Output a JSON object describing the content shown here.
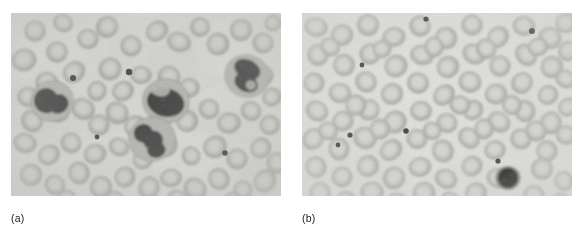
{
  "figure": {
    "kind": "photomicrograph-pair",
    "modality": "light microscopy, stained peripheral blood smear",
    "rendering": "grayscale",
    "panel_count": 2
  },
  "panels": [
    {
      "id": "a",
      "caption": "(a)",
      "label_letter": "a",
      "description": "Peripheral blood smear showing several large dark-stained leukocytes with lobed nuclei among loosely scattered erythrocytes",
      "frame": {
        "x": 11,
        "y": 13,
        "width": 270,
        "height": 183
      },
      "background_color": "#d9d9d6",
      "vignette_color": "#c6c6c2",
      "cell_counts": {
        "erythrocytes": 64,
        "leukocytes": 4,
        "platelets": 4
      },
      "erythrocyte_fill": "#c2c2bd",
      "erythrocyte_rim": "#a8a8a3",
      "erythrocyte_center": "#d2d2ce",
      "leukocyte_cytoplasm": "#b9b9b4",
      "leukocyte_nucleus": "#4a4a48",
      "platelet_color": "#3c3c3a",
      "erythrocytes": [
        {
          "cx": 24,
          "cy": 18,
          "r": 11,
          "rot": 12
        },
        {
          "cx": 52,
          "cy": 10,
          "r": 10,
          "rot": 30
        },
        {
          "cx": 13,
          "cy": 47,
          "r": 12,
          "rot": -10
        },
        {
          "cx": 46,
          "cy": 39,
          "r": 11,
          "rot": 45
        },
        {
          "cx": 77,
          "cy": 26,
          "r": 11,
          "rot": 5
        },
        {
          "cx": 96,
          "cy": 14,
          "r": 11,
          "rot": 60
        },
        {
          "cx": 120,
          "cy": 33,
          "r": 10,
          "rot": 22
        },
        {
          "cx": 146,
          "cy": 18,
          "r": 11,
          "rot": -35
        },
        {
          "cx": 168,
          "cy": 29,
          "r": 11,
          "rot": 18
        },
        {
          "cx": 189,
          "cy": 14,
          "r": 10,
          "rot": 50
        },
        {
          "cx": 207,
          "cy": 31,
          "r": 11,
          "rot": -20
        },
        {
          "cx": 230,
          "cy": 17,
          "r": 11,
          "rot": 8
        },
        {
          "cx": 252,
          "cy": 30,
          "r": 11,
          "rot": 40
        },
        {
          "cx": 262,
          "cy": 10,
          "r": 9,
          "rot": -15
        },
        {
          "cx": 36,
          "cy": 70,
          "r": 11,
          "rot": 25
        },
        {
          "cx": 63,
          "cy": 59,
          "r": 11,
          "rot": -40
        },
        {
          "cx": 86,
          "cy": 78,
          "r": 10,
          "rot": 15
        },
        {
          "cx": 99,
          "cy": 56,
          "r": 11,
          "rot": 33
        },
        {
          "cx": 112,
          "cy": 78,
          "r": 11,
          "rot": -25
        },
        {
          "cx": 130,
          "cy": 62,
          "r": 10,
          "rot": 5
        },
        {
          "cx": 158,
          "cy": 64,
          "r": 11,
          "rot": 48
        },
        {
          "cx": 178,
          "cy": 75,
          "r": 10,
          "rot": -12
        },
        {
          "cx": 252,
          "cy": 62,
          "r": 11,
          "rot": 20
        },
        {
          "cx": 261,
          "cy": 84,
          "r": 10,
          "rot": -30
        },
        {
          "cx": 17,
          "cy": 84,
          "r": 11,
          "rot": 10
        },
        {
          "cx": 21,
          "cy": 108,
          "r": 11,
          "rot": 55
        },
        {
          "cx": 48,
          "cy": 100,
          "r": 10,
          "rot": -18
        },
        {
          "cx": 72,
          "cy": 96,
          "r": 11,
          "rot": 28
        },
        {
          "cx": 88,
          "cy": 112,
          "r": 10,
          "rot": -5
        },
        {
          "cx": 106,
          "cy": 100,
          "r": 11,
          "rot": 42
        },
        {
          "cx": 124,
          "cy": 113,
          "r": 10,
          "rot": -28
        },
        {
          "cx": 150,
          "cy": 104,
          "r": 11,
          "rot": 16
        },
        {
          "cx": 176,
          "cy": 108,
          "r": 11,
          "rot": -44
        },
        {
          "cx": 198,
          "cy": 96,
          "r": 10,
          "rot": 24
        },
        {
          "cx": 218,
          "cy": 110,
          "r": 11,
          "rot": -8
        },
        {
          "cx": 240,
          "cy": 98,
          "r": 11,
          "rot": 36
        },
        {
          "cx": 259,
          "cy": 112,
          "r": 10,
          "rot": -22
        },
        {
          "cx": 14,
          "cy": 130,
          "r": 11,
          "rot": 14
        },
        {
          "cx": 38,
          "cy": 142,
          "r": 11,
          "rot": -32
        },
        {
          "cx": 60,
          "cy": 130,
          "r": 10,
          "rot": 46
        },
        {
          "cx": 84,
          "cy": 141,
          "r": 11,
          "rot": -14
        },
        {
          "cx": 108,
          "cy": 134,
          "r": 10,
          "rot": 26
        },
        {
          "cx": 132,
          "cy": 146,
          "r": 11,
          "rot": -38
        },
        {
          "cx": 156,
          "cy": 132,
          "r": 11,
          "rot": 9
        },
        {
          "cx": 180,
          "cy": 143,
          "r": 10,
          "rot": 52
        },
        {
          "cx": 204,
          "cy": 134,
          "r": 11,
          "rot": -26
        },
        {
          "cx": 226,
          "cy": 146,
          "r": 11,
          "rot": 19
        },
        {
          "cx": 250,
          "cy": 135,
          "r": 10,
          "rot": -48
        },
        {
          "cx": 266,
          "cy": 150,
          "r": 10,
          "rot": 31
        },
        {
          "cx": 20,
          "cy": 162,
          "r": 11,
          "rot": -11
        },
        {
          "cx": 44,
          "cy": 172,
          "r": 10,
          "rot": 38
        },
        {
          "cx": 68,
          "cy": 160,
          "r": 11,
          "rot": -20
        },
        {
          "cx": 90,
          "cy": 174,
          "r": 11,
          "rot": 6
        },
        {
          "cx": 114,
          "cy": 164,
          "r": 10,
          "rot": -44
        },
        {
          "cx": 138,
          "cy": 175,
          "r": 11,
          "rot": 23
        },
        {
          "cx": 160,
          "cy": 165,
          "r": 10,
          "rot": -6
        },
        {
          "cx": 184,
          "cy": 176,
          "r": 11,
          "rot": 41
        },
        {
          "cx": 208,
          "cy": 166,
          "r": 11,
          "rot": -30
        },
        {
          "cx": 232,
          "cy": 177,
          "r": 10,
          "rot": 13
        },
        {
          "cx": 254,
          "cy": 168,
          "r": 11,
          "rot": -50
        },
        {
          "cx": 56,
          "cy": 186,
          "r": 10,
          "rot": 27
        },
        {
          "cx": 104,
          "cy": 188,
          "r": 10,
          "rot": -16
        },
        {
          "cx": 166,
          "cy": 187,
          "r": 10,
          "rot": 35
        },
        {
          "cx": 222,
          "cy": 189,
          "r": 10,
          "rot": -24
        }
      ],
      "leukocytes": [
        {
          "cx": 41,
          "cy": 88,
          "r": 21,
          "nucleus": "bilobed",
          "rot": -18
        },
        {
          "cx": 155,
          "cy": 88,
          "r": 23,
          "nucleus": "reniform",
          "rot": 14
        },
        {
          "cx": 141,
          "cy": 126,
          "r": 23,
          "nucleus": "trilobed",
          "rot": -8
        },
        {
          "cx": 236,
          "cy": 63,
          "r": 22,
          "nucleus": "segmented",
          "rot": 26
        }
      ],
      "platelets": [
        {
          "cx": 62,
          "cy": 65,
          "r": 3.0
        },
        {
          "cx": 118,
          "cy": 59,
          "r": 3.2
        },
        {
          "cx": 86,
          "cy": 124,
          "r": 2.4
        },
        {
          "cx": 214,
          "cy": 140,
          "r": 2.8
        }
      ]
    },
    {
      "id": "b",
      "caption": "(b)",
      "label_letter": "b",
      "description": "Peripheral blood smear showing densely packed uniform erythrocytes with a single small dark-stained lymphocyte near the lower right",
      "frame": {
        "x": 302,
        "y": 13,
        "width": 270,
        "height": 183
      },
      "background_color": "#e3e3e1",
      "vignette_color": "#d2d2cf",
      "cell_counts": {
        "erythrocytes": 88,
        "leukocytes": 1,
        "platelets": 7
      },
      "erythrocyte_fill": "#c7c7c2",
      "erythrocyte_rim": "#adada8",
      "erythrocyte_center": "#d9d9d5",
      "leukocyte_cytoplasm": "#8f8f8b",
      "leukocyte_nucleus": "#1d1d1c",
      "platelet_color": "#333331",
      "erythrocytes": [
        {
          "cx": 14,
          "cy": 14,
          "r": 11,
          "rot": 10
        },
        {
          "cx": 40,
          "cy": 22,
          "r": 11,
          "rot": -22
        },
        {
          "cx": 66,
          "cy": 12,
          "r": 11,
          "rot": 34
        },
        {
          "cx": 92,
          "cy": 24,
          "r": 11,
          "rot": -8
        },
        {
          "cx": 118,
          "cy": 13,
          "r": 11,
          "rot": 46
        },
        {
          "cx": 144,
          "cy": 25,
          "r": 11,
          "rot": -30
        },
        {
          "cx": 170,
          "cy": 12,
          "r": 11,
          "rot": 18
        },
        {
          "cx": 196,
          "cy": 24,
          "r": 11,
          "rot": -44
        },
        {
          "cx": 222,
          "cy": 13,
          "r": 11,
          "rot": 6
        },
        {
          "cx": 248,
          "cy": 25,
          "r": 11,
          "rot": 28
        },
        {
          "cx": 264,
          "cy": 10,
          "r": 10,
          "rot": -12
        },
        {
          "cx": 16,
          "cy": 42,
          "r": 11,
          "rot": 24
        },
        {
          "cx": 42,
          "cy": 52,
          "r": 11,
          "rot": -16
        },
        {
          "cx": 68,
          "cy": 41,
          "r": 11,
          "rot": 40
        },
        {
          "cx": 94,
          "cy": 53,
          "r": 11,
          "rot": -36
        },
        {
          "cx": 120,
          "cy": 42,
          "r": 11,
          "rot": 12
        },
        {
          "cx": 146,
          "cy": 54,
          "r": 11,
          "rot": -48
        },
        {
          "cx": 172,
          "cy": 41,
          "r": 11,
          "rot": 30
        },
        {
          "cx": 198,
          "cy": 53,
          "r": 11,
          "rot": -4
        },
        {
          "cx": 224,
          "cy": 42,
          "r": 11,
          "rot": 50
        },
        {
          "cx": 250,
          "cy": 54,
          "r": 11,
          "rot": -26
        },
        {
          "cx": 266,
          "cy": 38,
          "r": 10,
          "rot": 16
        },
        {
          "cx": 12,
          "cy": 70,
          "r": 11,
          "rot": -34
        },
        {
          "cx": 38,
          "cy": 80,
          "r": 11,
          "rot": 8
        },
        {
          "cx": 64,
          "cy": 69,
          "r": 11,
          "rot": 44
        },
        {
          "cx": 90,
          "cy": 81,
          "r": 11,
          "rot": -20
        },
        {
          "cx": 116,
          "cy": 70,
          "r": 11,
          "rot": 26
        },
        {
          "cx": 142,
          "cy": 82,
          "r": 11,
          "rot": -42
        },
        {
          "cx": 168,
          "cy": 69,
          "r": 11,
          "rot": 14
        },
        {
          "cx": 194,
          "cy": 81,
          "r": 11,
          "rot": -10
        },
        {
          "cx": 220,
          "cy": 70,
          "r": 11,
          "rot": 38
        },
        {
          "cx": 246,
          "cy": 82,
          "r": 11,
          "rot": -28
        },
        {
          "cx": 264,
          "cy": 66,
          "r": 10,
          "rot": 20
        },
        {
          "cx": 15,
          "cy": 98,
          "r": 11,
          "rot": 32
        },
        {
          "cx": 41,
          "cy": 108,
          "r": 11,
          "rot": -14
        },
        {
          "cx": 67,
          "cy": 97,
          "r": 11,
          "rot": 48
        },
        {
          "cx": 93,
          "cy": 109,
          "r": 11,
          "rot": -38
        },
        {
          "cx": 119,
          "cy": 98,
          "r": 11,
          "rot": 4
        },
        {
          "cx": 145,
          "cy": 110,
          "r": 11,
          "rot": 22
        },
        {
          "cx": 171,
          "cy": 97,
          "r": 11,
          "rot": -46
        },
        {
          "cx": 197,
          "cy": 109,
          "r": 11,
          "rot": 36
        },
        {
          "cx": 223,
          "cy": 98,
          "r": 11,
          "rot": -18
        },
        {
          "cx": 249,
          "cy": 110,
          "r": 11,
          "rot": 10
        },
        {
          "cx": 266,
          "cy": 94,
          "r": 10,
          "rot": -32
        },
        {
          "cx": 11,
          "cy": 126,
          "r": 11,
          "rot": 42
        },
        {
          "cx": 37,
          "cy": 136,
          "r": 11,
          "rot": -6
        },
        {
          "cx": 63,
          "cy": 125,
          "r": 11,
          "rot": 24
        },
        {
          "cx": 89,
          "cy": 137,
          "r": 11,
          "rot": -40
        },
        {
          "cx": 115,
          "cy": 126,
          "r": 11,
          "rot": 16
        },
        {
          "cx": 141,
          "cy": 138,
          "r": 11,
          "rot": -24
        },
        {
          "cx": 167,
          "cy": 125,
          "r": 11,
          "rot": 46
        },
        {
          "cx": 193,
          "cy": 137,
          "r": 11,
          "rot": -12
        },
        {
          "cx": 219,
          "cy": 126,
          "r": 11,
          "rot": 30
        },
        {
          "cx": 245,
          "cy": 138,
          "r": 11,
          "rot": -50
        },
        {
          "cx": 264,
          "cy": 122,
          "r": 10,
          "rot": 6
        },
        {
          "cx": 14,
          "cy": 154,
          "r": 11,
          "rot": -28
        },
        {
          "cx": 40,
          "cy": 164,
          "r": 11,
          "rot": 18
        },
        {
          "cx": 66,
          "cy": 153,
          "r": 11,
          "rot": -44
        },
        {
          "cx": 92,
          "cy": 165,
          "r": 11,
          "rot": 34
        },
        {
          "cx": 118,
          "cy": 154,
          "r": 11,
          "rot": -10
        },
        {
          "cx": 144,
          "cy": 166,
          "r": 11,
          "rot": 26
        },
        {
          "cx": 170,
          "cy": 153,
          "r": 11,
          "rot": -36
        },
        {
          "cx": 196,
          "cy": 165,
          "r": 11,
          "rot": 12
        },
        {
          "cx": 240,
          "cy": 156,
          "r": 11,
          "rot": 40
        },
        {
          "cx": 262,
          "cy": 168,
          "r": 10,
          "rot": -20
        },
        {
          "cx": 18,
          "cy": 180,
          "r": 11,
          "rot": 22
        },
        {
          "cx": 44,
          "cy": 188,
          "r": 10,
          "rot": -48
        },
        {
          "cx": 70,
          "cy": 179,
          "r": 11,
          "rot": 8
        },
        {
          "cx": 96,
          "cy": 189,
          "r": 10,
          "rot": 30
        },
        {
          "cx": 122,
          "cy": 180,
          "r": 11,
          "rot": -16
        },
        {
          "cx": 148,
          "cy": 189,
          "r": 10,
          "rot": 44
        },
        {
          "cx": 174,
          "cy": 180,
          "r": 11,
          "rot": -30
        },
        {
          "cx": 232,
          "cy": 182,
          "r": 11,
          "rot": 14
        },
        {
          "cx": 258,
          "cy": 190,
          "r": 10,
          "rot": -42
        },
        {
          "cx": 28,
          "cy": 34,
          "r": 10,
          "rot": 36
        },
        {
          "cx": 80,
          "cy": 36,
          "r": 10,
          "rot": -24
        },
        {
          "cx": 132,
          "cy": 34,
          "r": 10,
          "rot": 8
        },
        {
          "cx": 184,
          "cy": 36,
          "r": 10,
          "rot": 48
        },
        {
          "cx": 236,
          "cy": 34,
          "r": 10,
          "rot": -14
        },
        {
          "cx": 26,
          "cy": 118,
          "r": 10,
          "rot": 20
        },
        {
          "cx": 78,
          "cy": 116,
          "r": 10,
          "rot": -38
        },
        {
          "cx": 130,
          "cy": 118,
          "r": 10,
          "rot": 42
        },
        {
          "cx": 182,
          "cy": 116,
          "r": 10,
          "rot": -6
        },
        {
          "cx": 234,
          "cy": 118,
          "r": 10,
          "rot": 28
        },
        {
          "cx": 54,
          "cy": 92,
          "r": 10,
          "rot": -46
        },
        {
          "cx": 158,
          "cy": 92,
          "r": 10,
          "rot": 10
        },
        {
          "cx": 210,
          "cy": 92,
          "r": 10,
          "rot": -32
        }
      ],
      "leukocytes": [
        {
          "cx": 206,
          "cy": 165,
          "r": 12,
          "nucleus": "round-dense",
          "rot": 0
        }
      ],
      "platelets": [
        {
          "cx": 124,
          "cy": 6,
          "r": 2.6
        },
        {
          "cx": 230,
          "cy": 18,
          "r": 3.0
        },
        {
          "cx": 60,
          "cy": 52,
          "r": 2.4
        },
        {
          "cx": 48,
          "cy": 122,
          "r": 2.6
        },
        {
          "cx": 36,
          "cy": 132,
          "r": 2.4
        },
        {
          "cx": 104,
          "cy": 118,
          "r": 2.8
        },
        {
          "cx": 196,
          "cy": 148,
          "r": 2.6
        }
      ]
    }
  ]
}
